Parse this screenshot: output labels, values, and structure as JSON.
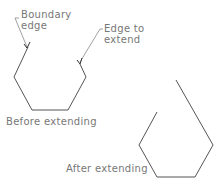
{
  "labels": {
    "boundary_edge_line1": "Boundary",
    "boundary_edge_line2": "edge",
    "edge_to_extend_line1": "Edge to",
    "edge_to_extend_line2": "extend",
    "before": "Before extending",
    "after": "After extending"
  },
  "colors": {
    "shape": "#555555",
    "leader": "#888888",
    "text": "#777777"
  }
}
